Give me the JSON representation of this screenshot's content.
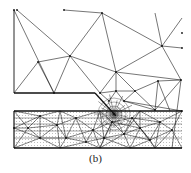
{
  "figure": {
    "caption": "(b)",
    "colors": {
      "line": "#1a1a1a",
      "stipple": "#9a9a9a",
      "background": "#ffffff"
    },
    "boundaries": {
      "left_edge": [
        [
          14,
          10
        ],
        [
          14,
          93
        ]
      ],
      "crack_face": [
        [
          14,
          93
        ],
        [
          95,
          93
        ]
      ],
      "crack_diagonal": [
        [
          95,
          93
        ],
        [
          116,
          116
        ]
      ],
      "layer_top": [
        [
          14,
          111
        ],
        [
          182,
          111
        ]
      ],
      "layer_bottom": [
        [
          14,
          148
        ],
        [
          182,
          148
        ]
      ],
      "layer_left": [
        [
          14,
          111
        ],
        [
          14,
          148
        ]
      ]
    },
    "coarse_nodes": [
      [
        14,
        10
      ],
      [
        17,
        10
      ],
      [
        64,
        10
      ],
      [
        102,
        13
      ],
      [
        70,
        56
      ],
      [
        38,
        62
      ],
      [
        54,
        93
      ],
      [
        162,
        46
      ],
      [
        182,
        48
      ],
      [
        116,
        72
      ],
      [
        181,
        80
      ],
      [
        158,
        81
      ],
      [
        135,
        91
      ],
      [
        116,
        91
      ],
      [
        100,
        93
      ],
      [
        109,
        101
      ],
      [
        124,
        101
      ],
      [
        155,
        110
      ],
      [
        182,
        111
      ],
      [
        182,
        33
      ]
    ],
    "coarse_edges": [
      [
        [
          17,
          10
        ],
        [
          70,
          56
        ]
      ],
      [
        [
          14,
          10
        ],
        [
          54,
          93
        ]
      ],
      [
        [
          64,
          10
        ],
        [
          102,
          13
        ]
      ],
      [
        [
          102,
          13
        ],
        [
          70,
          56
        ]
      ],
      [
        [
          102,
          13
        ],
        [
          162,
          46
        ]
      ],
      [
        [
          102,
          13
        ],
        [
          116,
          72
        ]
      ],
      [
        [
          70,
          56
        ],
        [
          38,
          62
        ]
      ],
      [
        [
          38,
          62
        ],
        [
          14,
          93
        ]
      ],
      [
        [
          38,
          62
        ],
        [
          54,
          93
        ]
      ],
      [
        [
          70,
          56
        ],
        [
          54,
          93
        ]
      ],
      [
        [
          70,
          56
        ],
        [
          100,
          93
        ]
      ],
      [
        [
          70,
          56
        ],
        [
          116,
          72
        ]
      ],
      [
        [
          116,
          72
        ],
        [
          162,
          46
        ]
      ],
      [
        [
          162,
          46
        ],
        [
          182,
          48
        ]
      ],
      [
        [
          162,
          46
        ],
        [
          181,
          80
        ]
      ],
      [
        [
          162,
          46
        ],
        [
          155,
          13
        ]
      ],
      [
        [
          162,
          46
        ],
        [
          182,
          18
        ]
      ],
      [
        [
          116,
          72
        ],
        [
          181,
          80
        ]
      ],
      [
        [
          116,
          72
        ],
        [
          100,
          93
        ]
      ],
      [
        [
          116,
          72
        ],
        [
          135,
          91
        ]
      ],
      [
        [
          116,
          72
        ],
        [
          116,
          91
        ]
      ],
      [
        [
          181,
          80
        ],
        [
          158,
          81
        ]
      ],
      [
        [
          181,
          80
        ],
        [
          155,
          110
        ]
      ],
      [
        [
          181,
          80
        ],
        [
          172,
          148
        ]
      ],
      [
        [
          158,
          81
        ],
        [
          135,
          91
        ]
      ],
      [
        [
          158,
          81
        ],
        [
          155,
          110
        ]
      ],
      [
        [
          135,
          91
        ],
        [
          116,
          91
        ]
      ],
      [
        [
          135,
          91
        ],
        [
          124,
          101
        ]
      ],
      [
        [
          135,
          91
        ],
        [
          155,
          110
        ]
      ],
      [
        [
          116,
          91
        ],
        [
          100,
          93
        ]
      ],
      [
        [
          116,
          91
        ],
        [
          109,
          101
        ]
      ],
      [
        [
          116,
          91
        ],
        [
          124,
          101
        ]
      ],
      [
        [
          100,
          93
        ],
        [
          109,
          101
        ]
      ],
      [
        [
          124,
          101
        ],
        [
          155,
          110
        ]
      ],
      [
        [
          124,
          101
        ],
        [
          182,
          111
        ]
      ],
      [
        [
          158,
          81
        ],
        [
          170,
          111
        ]
      ]
    ],
    "layer_nodes": [
      [
        14,
        128
      ],
      [
        40,
        116
      ],
      [
        57,
        125
      ],
      [
        76,
        118
      ],
      [
        93,
        130
      ],
      [
        40,
        138
      ],
      [
        66,
        138
      ],
      [
        104,
        138
      ],
      [
        124,
        134
      ],
      [
        140,
        128
      ],
      [
        150,
        140
      ],
      [
        172,
        130
      ],
      [
        28,
        128
      ],
      [
        86,
        142
      ],
      [
        112,
        122
      ],
      [
        132,
        118
      ],
      [
        160,
        122
      ]
    ]
  }
}
